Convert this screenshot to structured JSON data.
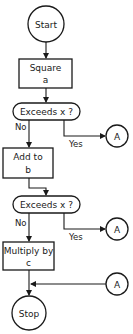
{
  "flowchart": {
    "start": {
      "label": "Start"
    },
    "step1": {
      "line1": "Square",
      "line2": "a"
    },
    "decision1": {
      "label": "Exceeds x ?",
      "no": "No",
      "yes": "Yes"
    },
    "connector1": {
      "label": "A"
    },
    "step2": {
      "line1": "Add to",
      "line2": "b"
    },
    "decision2": {
      "label": "Exceeds x ?",
      "no": "No",
      "yes": "Yes"
    },
    "connector2": {
      "label": "A"
    },
    "step3": {
      "line1": "Multiply by",
      "line2": "c"
    },
    "connector3": {
      "label": "A"
    },
    "stop": {
      "label": "Stop"
    }
  }
}
